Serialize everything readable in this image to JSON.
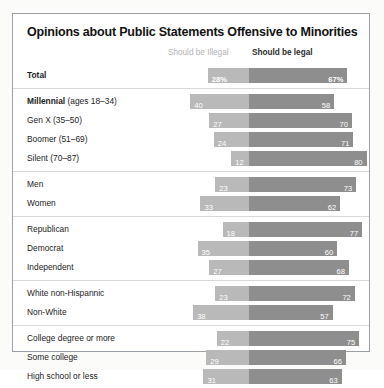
{
  "chart_data": {
    "type": "bar",
    "subtype": "diverging-stacked-bar",
    "title": "Opinions about Public Statements Offensive to Minorities",
    "xlabel": "",
    "ylabel": "",
    "legend": [
      {
        "name": "Should be Illegal",
        "color": "#b9b9b9",
        "emphasis": "normal"
      },
      {
        "name": "Should be legal",
        "color": "#8e8e8e",
        "emphasis": "bold"
      }
    ],
    "legend_position": "top",
    "grid": false,
    "value_unit": "percent",
    "divider_at": 0,
    "categories": [
      "Total",
      "Millennial (ages 18–34)",
      "Gen X (35–50)",
      "Boomer (51–69)",
      "Silent (70–87)",
      "Men",
      "Women",
      "Republican",
      "Democrat",
      "Independent",
      "White non-Hispannic",
      "Non-White",
      "College degree or more",
      "Some college",
      "High school or less"
    ],
    "series": [
      {
        "name": "Should be Illegal",
        "values": [
          28,
          40,
          27,
          24,
          12,
          23,
          33,
          18,
          35,
          27,
          23,
          38,
          22,
          29,
          31
        ]
      },
      {
        "name": "Should be legal",
        "values": [
          67,
          58,
          70,
          71,
          80,
          73,
          62,
          77,
          60,
          68,
          72,
          57,
          75,
          66,
          63
        ]
      }
    ],
    "groups": [
      {
        "name": "total",
        "rows": [
          0
        ]
      },
      {
        "name": "generation",
        "rows": [
          1,
          2,
          3,
          4
        ]
      },
      {
        "name": "gender",
        "rows": [
          5,
          6
        ]
      },
      {
        "name": "party",
        "rows": [
          7,
          8,
          9
        ]
      },
      {
        "name": "race",
        "rows": [
          10,
          11
        ]
      },
      {
        "name": "education",
        "rows": [
          12,
          13,
          14
        ]
      }
    ]
  },
  "chart": {
    "title": "Opinions about Public Statements Offensive to Minorities",
    "legend": {
      "illegal": "Should be Illegal",
      "legal": "Should be legal"
    },
    "colors": {
      "illegal": "#b9b9b9",
      "legal": "#8e8e8e",
      "border": "#9aa0a6",
      "separator": "#d8d8d8",
      "label": "#1d1d1d",
      "value": "#ffffff"
    },
    "groups": [
      {
        "rows": [
          {
            "label": "Total",
            "label_bold": "Total",
            "label_sub": "",
            "bold": true,
            "illegal": 28,
            "legal": 67,
            "illegal_text": "28%",
            "legal_text": "67%"
          }
        ]
      },
      {
        "rows": [
          {
            "label": "Millennial (ages 18–34)",
            "label_bold": "Millennial",
            "label_sub": " (ages 18–34)",
            "bold": true,
            "illegal": 40,
            "legal": 58,
            "illegal_text": "40",
            "legal_text": "58"
          },
          {
            "label": "Gen X (35–50)",
            "label_bold": "",
            "label_sub": "Gen X (35–50)",
            "bold": false,
            "illegal": 27,
            "legal": 70,
            "illegal_text": "27",
            "legal_text": "70"
          },
          {
            "label": "Boomer (51–69)",
            "label_bold": "",
            "label_sub": "Boomer (51–69)",
            "bold": false,
            "illegal": 24,
            "legal": 71,
            "illegal_text": "24",
            "legal_text": "71"
          },
          {
            "label": "Silent (70–87)",
            "label_bold": "",
            "label_sub": "Silent (70–87)",
            "bold": false,
            "illegal": 12,
            "legal": 80,
            "illegal_text": "12",
            "legal_text": "80"
          }
        ]
      },
      {
        "rows": [
          {
            "label": "Men",
            "label_bold": "",
            "label_sub": "Men",
            "bold": false,
            "illegal": 23,
            "legal": 73,
            "illegal_text": "23",
            "legal_text": "73"
          },
          {
            "label": "Women",
            "label_bold": "",
            "label_sub": "Women",
            "bold": false,
            "illegal": 33,
            "legal": 62,
            "illegal_text": "33",
            "legal_text": "62"
          }
        ]
      },
      {
        "rows": [
          {
            "label": "Republican",
            "label_bold": "",
            "label_sub": "Republican",
            "bold": false,
            "illegal": 18,
            "legal": 77,
            "illegal_text": "18",
            "legal_text": "77"
          },
          {
            "label": "Democrat",
            "label_bold": "",
            "label_sub": "Democrat",
            "bold": false,
            "illegal": 35,
            "legal": 60,
            "illegal_text": "35",
            "legal_text": "60"
          },
          {
            "label": "Independent",
            "label_bold": "",
            "label_sub": "Independent",
            "bold": false,
            "illegal": 27,
            "legal": 68,
            "illegal_text": "27",
            "legal_text": "68"
          }
        ]
      },
      {
        "rows": [
          {
            "label": "White non-Hispannic",
            "label_bold": "",
            "label_sub": "White non-Hispannic",
            "bold": false,
            "illegal": 23,
            "legal": 72,
            "illegal_text": "23",
            "legal_text": "72"
          },
          {
            "label": "Non-White",
            "label_bold": "",
            "label_sub": "Non-White",
            "bold": false,
            "illegal": 38,
            "legal": 57,
            "illegal_text": "38",
            "legal_text": "57"
          }
        ]
      },
      {
        "rows": [
          {
            "label": "College degree or more",
            "label_bold": "",
            "label_sub": "College degree or more",
            "bold": false,
            "illegal": 22,
            "legal": 75,
            "illegal_text": "22",
            "legal_text": "75"
          },
          {
            "label": "Some college",
            "label_bold": "",
            "label_sub": "Some college",
            "bold": false,
            "illegal": 29,
            "legal": 66,
            "illegal_text": "29",
            "legal_text": "66"
          },
          {
            "label": "High school or less",
            "label_bold": "",
            "label_sub": "High school or less",
            "bold": false,
            "illegal": 31,
            "legal": 63,
            "illegal_text": "31",
            "legal_text": "63"
          }
        ]
      }
    ]
  }
}
